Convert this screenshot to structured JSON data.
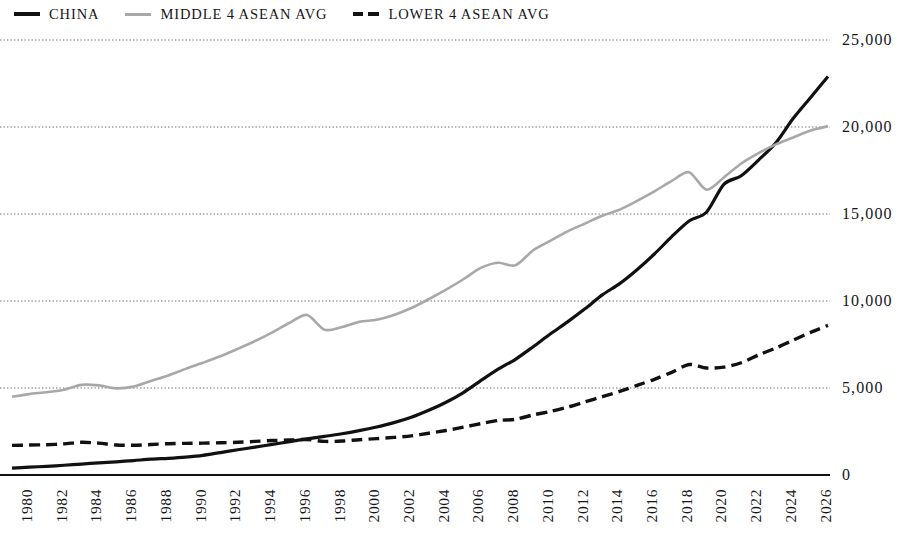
{
  "legend": {
    "position": "top-left",
    "items": [
      {
        "label": "CHINA",
        "style": "solid",
        "color": "#111111",
        "swatch_icon": "solid-line-icon"
      },
      {
        "label": "MIDDLE 4 ASEAN AVG",
        "style": "solid",
        "color": "#a8a8a8",
        "swatch_icon": "gray-line-icon"
      },
      {
        "label": "LOWER 4 ASEAN AVG",
        "style": "dashed",
        "color": "#111111",
        "swatch_icon": "dashed-line-icon"
      }
    ]
  },
  "axis": {
    "y_ticks": [
      "0",
      "5,000",
      "10,000",
      "15,000",
      "20,000",
      "25,000"
    ],
    "x_ticks": [
      "1980",
      "1982",
      "1984",
      "1986",
      "1988",
      "1990",
      "1992",
      "1994",
      "1996",
      "1998",
      "2000",
      "2002",
      "2004",
      "2006",
      "2008",
      "2010",
      "2012",
      "2014",
      "2016",
      "2018",
      "2020",
      "2022",
      "2024",
      "2026"
    ]
  },
  "chart_data": {
    "type": "line",
    "title": "",
    "subtitle": "",
    "xlabel": "",
    "ylabel": "",
    "xlim": [
      1980,
      2027
    ],
    "ylim": [
      0,
      25000
    ],
    "y_ticks": [
      0,
      5000,
      10000,
      15000,
      20000,
      25000
    ],
    "x_tick_step": 2,
    "grid": "horizontal-dotted",
    "legend_position": "top-left",
    "x": [
      1980,
      1981,
      1982,
      1983,
      1984,
      1985,
      1986,
      1987,
      1988,
      1989,
      1990,
      1991,
      1992,
      1993,
      1994,
      1995,
      1996,
      1997,
      1998,
      1999,
      2000,
      2001,
      2002,
      2003,
      2004,
      2005,
      2006,
      2007,
      2008,
      2009,
      2010,
      2011,
      2012,
      2013,
      2014,
      2015,
      2016,
      2017,
      2018,
      2019,
      2020,
      2021,
      2022,
      2023,
      2024,
      2025,
      2026,
      2027
    ],
    "series": [
      {
        "name": "CHINA",
        "color": "#111111",
        "style": "solid",
        "width": 3.2,
        "values": [
          400,
          450,
          500,
          560,
          630,
          700,
          760,
          830,
          910,
          960,
          1030,
          1130,
          1290,
          1450,
          1600,
          1760,
          1920,
          2080,
          2220,
          2370,
          2550,
          2760,
          3010,
          3320,
          3720,
          4180,
          4740,
          5420,
          6080,
          6650,
          7360,
          8100,
          8800,
          9550,
          10350,
          11000,
          11800,
          12700,
          13700,
          14600,
          15100,
          16700,
          17200,
          18100,
          19100,
          20500,
          21700,
          22900
        ]
      },
      {
        "name": "MIDDLE 4 ASEAN AVG",
        "color": "#a8a8a8",
        "style": "solid",
        "width": 2.6,
        "values": [
          4500,
          4650,
          4760,
          4900,
          5180,
          5150,
          4980,
          5080,
          5400,
          5720,
          6100,
          6450,
          6820,
          7250,
          7700,
          8200,
          8750,
          9200,
          8350,
          8500,
          8800,
          8920,
          9200,
          9600,
          10100,
          10650,
          11250,
          11900,
          12200,
          12050,
          12900,
          13450,
          14000,
          14450,
          14900,
          15250,
          15750,
          16300,
          16900,
          17400,
          16400,
          17100,
          17900,
          18500,
          19000,
          19400,
          19800,
          20050
        ]
      },
      {
        "name": "LOWER 4 ASEAN AVG",
        "color": "#111111",
        "style": "dashed",
        "width": 3.4,
        "values": [
          1700,
          1720,
          1740,
          1790,
          1880,
          1830,
          1720,
          1710,
          1750,
          1800,
          1820,
          1830,
          1850,
          1880,
          1930,
          1980,
          2010,
          2040,
          1930,
          1950,
          2030,
          2090,
          2160,
          2250,
          2400,
          2560,
          2750,
          2950,
          3130,
          3200,
          3450,
          3650,
          3900,
          4200,
          4500,
          4800,
          5150,
          5500,
          5900,
          6350,
          6150,
          6200,
          6450,
          6900,
          7300,
          7750,
          8200,
          8600
        ]
      }
    ]
  }
}
